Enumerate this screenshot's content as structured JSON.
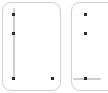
{
  "canvas": {
    "width": 108,
    "height": 93,
    "background": "#ffffff"
  },
  "theme": {
    "panel_background": "#ffffff",
    "panel_border": "#d2d2d2",
    "track_color": "#cfcfcf",
    "marker_color": "#2b2b2b"
  },
  "panels": [
    {
      "id": "left-panel",
      "x": 2,
      "y": 2,
      "width": 59,
      "height": 89,
      "corner_radius": 9,
      "tracks": [
        {
          "orientation": "vertical",
          "x": 13,
          "y1": 8,
          "y2": 80
        }
      ],
      "markers": [
        {
          "x": 13,
          "y": 14
        },
        {
          "x": 13,
          "y": 33
        },
        {
          "x": 13,
          "y": 78
        },
        {
          "x": 52,
          "y": 78
        }
      ]
    },
    {
      "id": "right-panel",
      "x": 71,
      "y": 2,
      "width": 59,
      "height": 89,
      "corner_radius": 9,
      "tracks": [
        {
          "orientation": "horizontal",
          "y": 78,
          "x1": 73,
          "x2": 101
        }
      ],
      "markers": [
        {
          "x": 85,
          "y": 14
        },
        {
          "x": 85,
          "y": 33
        },
        {
          "x": 85,
          "y": 78
        }
      ]
    }
  ]
}
